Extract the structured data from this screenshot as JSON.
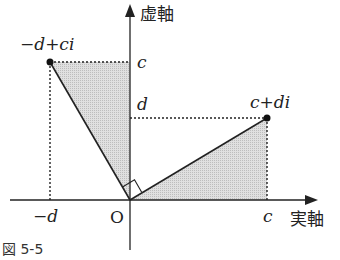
{
  "figure": {
    "caption": "図 5-5",
    "axes": {
      "real_label": "実軸",
      "imag_label": "虚軸",
      "origin_label": "O"
    },
    "ticks": {
      "x_neg_d": "−d",
      "x_c": "c",
      "y_c": "c",
      "y_d": "d"
    },
    "points": [
      {
        "label": "−d+ci",
        "x": -1,
        "y": 2
      },
      {
        "label": "c+di",
        "x": 2,
        "y": 1
      }
    ],
    "colors": {
      "shade": "#d6d6d6",
      "line": "#222222"
    },
    "annotations": [
      "right angle at O between the two vectors",
      "shaded triangles congruent"
    ]
  }
}
